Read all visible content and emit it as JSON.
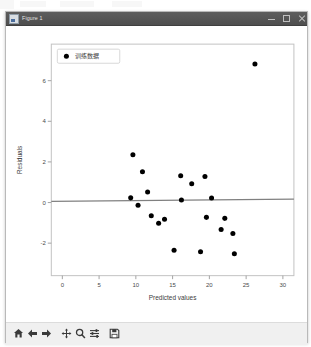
{
  "window": {
    "title": "Figure 1",
    "icon": "matplotlib-figure-icon",
    "controls": {
      "minimize": "–",
      "maximize": "□",
      "close": "×"
    }
  },
  "toolbar": {
    "buttons": [
      {
        "name": "home-icon",
        "tooltip": "Reset original view"
      },
      {
        "name": "back-arrow-icon",
        "tooltip": "Back to previous view"
      },
      {
        "name": "forward-arrow-icon",
        "tooltip": "Forward to next view"
      },
      {
        "name": "pan-move-icon",
        "tooltip": "Pan axes with left mouse, zoom with right"
      },
      {
        "name": "zoom-magnifier-icon",
        "tooltip": "Zoom to rectangle"
      },
      {
        "name": "configure-subplots-icon",
        "tooltip": "Configure subplots"
      },
      {
        "name": "save-disk-icon",
        "tooltip": "Save the figure"
      }
    ]
  },
  "chart_data": {
    "type": "scatter",
    "title": "",
    "xlabel": "Predicted values",
    "ylabel": "Residuals",
    "xlim": [
      -1.5,
      31.5
    ],
    "ylim": [
      -3.6,
      7.8
    ],
    "xticks": [
      0,
      5,
      10,
      15,
      20,
      25,
      30
    ],
    "xticklabels": [
      "0",
      "5",
      "10",
      "15",
      "20",
      "25",
      "30"
    ],
    "yticks": [
      -2,
      0,
      2,
      4,
      6
    ],
    "yticklabels": [
      "-2",
      "0",
      "2",
      "4",
      "6"
    ],
    "grid": false,
    "legend": {
      "position": "upper left",
      "entries": [
        {
          "label": "训练数据",
          "marker": "circle",
          "color": "#000000"
        }
      ]
    },
    "series": [
      {
        "name": "训练数据",
        "marker": "circle",
        "color": "#000000",
        "points": [
          [
            9.6,
            2.35
          ],
          [
            10.9,
            1.52
          ],
          [
            9.3,
            0.23
          ],
          [
            10.3,
            -0.13
          ],
          [
            11.6,
            0.52
          ],
          [
            12.1,
            -0.65
          ],
          [
            13.1,
            -1.02
          ],
          [
            13.9,
            -0.82
          ],
          [
            15.2,
            -2.35
          ],
          [
            16.1,
            1.32
          ],
          [
            17.6,
            0.92
          ],
          [
            16.2,
            0.12
          ],
          [
            18.8,
            -2.42
          ],
          [
            19.4,
            1.28
          ],
          [
            19.6,
            -0.73
          ],
          [
            20.3,
            0.22
          ],
          [
            21.6,
            -1.33
          ],
          [
            22.1,
            -0.78
          ],
          [
            23.2,
            -1.52
          ],
          [
            23.4,
            -2.52
          ],
          [
            26.2,
            6.82
          ]
        ]
      }
    ],
    "reference_line": {
      "name": "zero-residual-line",
      "color": "#808080",
      "x_start": -1.5,
      "y_start": 0.06,
      "x_end": 31.5,
      "y_end": 0.17
    }
  }
}
